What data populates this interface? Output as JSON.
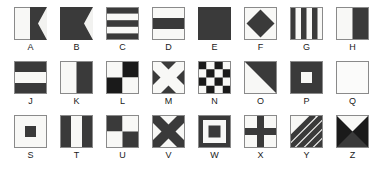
{
  "diagram": {
    "colors": {
      "dark": "#3a3a3a",
      "light": "#f2f2f0",
      "border": "#8a8a8a",
      "label": "#1a1a1a",
      "background": "#ffffff"
    },
    "rows": [
      {
        "row_index": 1,
        "flags": [
          {
            "letter": "A",
            "pattern": "swallowtail-vertical-half",
            "description": "White hoist half, dark fly half with swallowtail notch"
          },
          {
            "letter": "B",
            "pattern": "swallowtail-solid",
            "description": "Solid dark swallowtail pennant"
          },
          {
            "letter": "C",
            "pattern": "horizontal-stripes-5",
            "description": "Five horizontal stripes dark-light-dark-light-dark"
          },
          {
            "letter": "D",
            "pattern": "horizontal-bands-3",
            "description": "Light top, dark center band, light bottom"
          },
          {
            "letter": "E",
            "pattern": "solid-dark",
            "description": "Solid dark square"
          },
          {
            "letter": "F",
            "pattern": "diamond",
            "description": "Dark diamond centered on light field"
          },
          {
            "letter": "G",
            "pattern": "vertical-stripes-6",
            "description": "Six vertical stripes alternating dark and light"
          },
          {
            "letter": "H",
            "pattern": "vertical-half",
            "description": "Light hoist half, dark fly half"
          },
          {
            "letter": "I",
            "pattern": "circle",
            "description": "Dark filled circle centered on light field"
          }
        ]
      },
      {
        "row_index": 2,
        "flags": [
          {
            "letter": "J",
            "pattern": "horizontal-bands-3-inverse",
            "description": "Dark top, light center band, dark bottom"
          },
          {
            "letter": "K",
            "pattern": "vertical-half",
            "description": "Light hoist half, dark fly half"
          },
          {
            "letter": "L",
            "pattern": "quartered",
            "description": "Quartered light top-left, dark top-right, dark bottom-left, light bottom-right"
          },
          {
            "letter": "M",
            "pattern": "saltire-light",
            "description": "Light diagonal cross on dark field"
          },
          {
            "letter": "N",
            "pattern": "checkerboard-4x4",
            "description": "Four by four checkerboard of dark and light squares"
          },
          {
            "letter": "O",
            "pattern": "diagonal-split",
            "description": "Diagonal split, dark upper-right, light lower-left"
          },
          {
            "letter": "P",
            "pattern": "center-square-light",
            "description": "Dark field with light square in center"
          },
          {
            "letter": "Q",
            "pattern": "solid-light",
            "description": "Solid light square"
          },
          {
            "letter": "R",
            "pattern": "cross-light",
            "description": "Dark field with light upright cross"
          }
        ]
      },
      {
        "row_index": 3,
        "flags": [
          {
            "letter": "S",
            "pattern": "center-square-dark",
            "description": "Light field with dark square in center"
          },
          {
            "letter": "T",
            "pattern": "vertical-bands-3",
            "description": "Dark, light, dark vertical bands"
          },
          {
            "letter": "U",
            "pattern": "quartered-inverse",
            "description": "Quartered dark top-left, light top-right, light bottom-left, dark bottom-right"
          },
          {
            "letter": "V",
            "pattern": "saltire-dark",
            "description": "Dark diagonal cross on light field"
          },
          {
            "letter": "W",
            "pattern": "concentric-squares",
            "description": "Dark border, light ring, dark center square"
          },
          {
            "letter": "X",
            "pattern": "cross-dark",
            "description": "Light field with dark upright cross"
          },
          {
            "letter": "Y",
            "pattern": "diagonal-stripes",
            "description": "Diagonal stripes alternating dark and light"
          },
          {
            "letter": "Z",
            "pattern": "four-triangles",
            "description": "Four triangles, light top, dark left right and bottom"
          }
        ]
      }
    ]
  }
}
